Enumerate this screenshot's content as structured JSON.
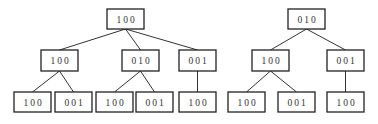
{
  "diagram": {
    "type": "tree-pair",
    "trees": [
      {
        "name": "left-tree",
        "nodes": [
          {
            "id": "L0",
            "label": "100",
            "x": 107,
            "y": 9,
            "w": 37,
            "h": 20
          },
          {
            "id": "L1a",
            "label": "100",
            "x": 41,
            "y": 50,
            "w": 37,
            "h": 21
          },
          {
            "id": "L1b",
            "label": "010",
            "x": 122,
            "y": 50,
            "w": 37,
            "h": 21
          },
          {
            "id": "L1c",
            "label": "001",
            "x": 179,
            "y": 50,
            "w": 37,
            "h": 21
          },
          {
            "id": "L2a",
            "label": "100",
            "x": 14,
            "y": 92,
            "w": 37,
            "h": 20
          },
          {
            "id": "L2b",
            "label": "001",
            "x": 55,
            "y": 92,
            "w": 37,
            "h": 20
          },
          {
            "id": "L2c",
            "label": "100",
            "x": 96,
            "y": 92,
            "w": 37,
            "h": 20
          },
          {
            "id": "L2d",
            "label": "001",
            "x": 136,
            "y": 92,
            "w": 37,
            "h": 20
          },
          {
            "id": "L2e",
            "label": "100",
            "x": 179,
            "y": 92,
            "w": 37,
            "h": 20
          }
        ],
        "edges": [
          [
            "L0",
            "L1a"
          ],
          [
            "L0",
            "L1b"
          ],
          [
            "L0",
            "L1c"
          ],
          [
            "L1a",
            "L2a"
          ],
          [
            "L1a",
            "L2b"
          ],
          [
            "L1b",
            "L2c"
          ],
          [
            "L1b",
            "L2d"
          ],
          [
            "L1c",
            "L2e"
          ]
        ]
      },
      {
        "name": "right-tree",
        "nodes": [
          {
            "id": "R0",
            "label": "010",
            "x": 288,
            "y": 9,
            "w": 37,
            "h": 20
          },
          {
            "id": "R1a",
            "label": "100",
            "x": 252,
            "y": 50,
            "w": 37,
            "h": 21
          },
          {
            "id": "R1b",
            "label": "001",
            "x": 327,
            "y": 50,
            "w": 37,
            "h": 21
          },
          {
            "id": "R2a",
            "label": "100",
            "x": 228,
            "y": 92,
            "w": 37,
            "h": 20
          },
          {
            "id": "R2b",
            "label": "001",
            "x": 278,
            "y": 92,
            "w": 37,
            "h": 20
          },
          {
            "id": "R2c",
            "label": "100",
            "x": 327,
            "y": 92,
            "w": 37,
            "h": 20
          }
        ],
        "edges": [
          [
            "R0",
            "R1a"
          ],
          [
            "R0",
            "R1b"
          ],
          [
            "R1a",
            "R2a"
          ],
          [
            "R1a",
            "R2b"
          ],
          [
            "R1b",
            "R2c"
          ]
        ]
      }
    ]
  }
}
